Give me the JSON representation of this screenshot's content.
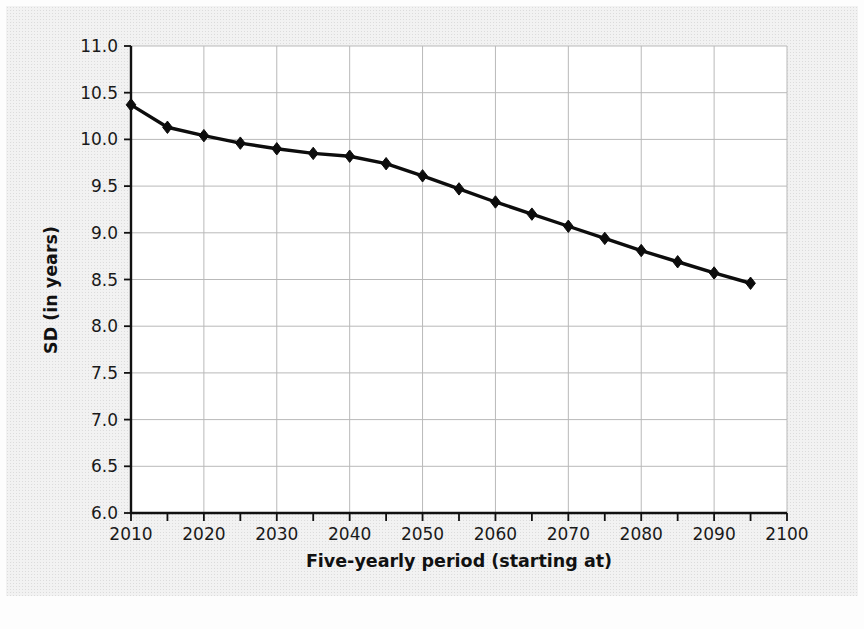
{
  "figure": {
    "background_color": "#f2f2f2",
    "plot_background_color": "#ffffff",
    "border_color": "#ffffff"
  },
  "chart_data": {
    "type": "line",
    "title": "",
    "xlabel": "Five-yearly period (starting at)",
    "ylabel": "SD (in years)",
    "xlim": [
      2010,
      2100
    ],
    "ylim": [
      6.0,
      11.0
    ],
    "xticks": [
      2010,
      2020,
      2030,
      2040,
      2050,
      2060,
      2070,
      2080,
      2090,
      2100
    ],
    "xtick_labels": [
      "2010",
      "2020",
      "2030",
      "2040",
      "2050",
      "2060",
      "2070",
      "2080",
      "2090",
      "2100"
    ],
    "x_minor_tick_step": 5,
    "yticks": [
      6.0,
      6.5,
      7.0,
      7.5,
      8.0,
      8.5,
      9.0,
      9.5,
      10.0,
      10.5,
      11.0
    ],
    "ytick_labels": [
      "6.0",
      "6.5",
      "7.0",
      "7.5",
      "8.0",
      "8.5",
      "9.0",
      "9.5",
      "10.0",
      "10.5",
      "11.0"
    ],
    "grid": true,
    "grid_color": "#b9b9b9",
    "legend": false,
    "legend_position": "none",
    "line_color": "#0d0d0d",
    "marker": "diamond",
    "x": [
      2010,
      2015,
      2020,
      2025,
      2030,
      2035,
      2040,
      2045,
      2050,
      2055,
      2060,
      2065,
      2070,
      2075,
      2080,
      2085,
      2090,
      2095
    ],
    "values": [
      10.37,
      10.13,
      10.04,
      9.96,
      9.9,
      9.85,
      9.82,
      9.74,
      9.61,
      9.47,
      9.33,
      9.2,
      9.07,
      8.94,
      8.81,
      8.69,
      8.57,
      8.46
    ],
    "series": [
      {
        "name": "SD",
        "values": [
          10.37,
          10.13,
          10.04,
          9.96,
          9.9,
          9.85,
          9.82,
          9.74,
          9.61,
          9.47,
          9.33,
          9.2,
          9.07,
          8.94,
          8.81,
          8.69,
          8.57,
          8.46
        ]
      }
    ]
  }
}
